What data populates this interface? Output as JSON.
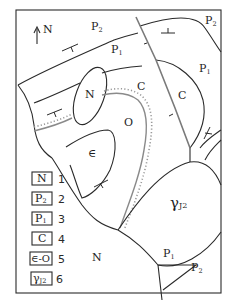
{
  "north_arrow": {
    "label": "N"
  },
  "map_labels": {
    "p2_top": "P",
    "p2_top_sub": "2",
    "p1_top": "P",
    "p1_top_sub": "1",
    "p2_right": "P",
    "p2_right_sub": "2",
    "p1_right": "P",
    "p1_right_sub": "1",
    "n_upper": "N",
    "c_center": "C",
    "c_right": "C",
    "o": "O",
    "cambrian": "∈",
    "granite": "γ",
    "granite_sub": "J2",
    "n_lower": "N",
    "p1_bottom": "P",
    "p1_bottom_sub": "1",
    "p2_bottom": "P",
    "p2_bottom_sub": "2"
  },
  "legend": [
    {
      "symbol": "N",
      "sub": "",
      "number": "1"
    },
    {
      "symbol": "P",
      "sub": "2",
      "number": "2"
    },
    {
      "symbol": "P",
      "sub": "1",
      "number": "3"
    },
    {
      "symbol": "C",
      "sub": "",
      "number": "4"
    },
    {
      "symbol": "∈-O",
      "sub": "",
      "number": "5"
    },
    {
      "symbol": "γ",
      "sub": "J2",
      "number": "6"
    }
  ]
}
